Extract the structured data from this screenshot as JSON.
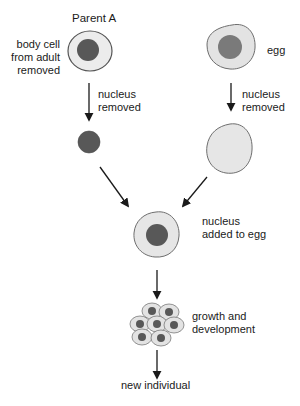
{
  "diagram": {
    "labels": {
      "parent_a": "Parent A",
      "body_cell": [
        "body cell",
        "from adult",
        "removed"
      ],
      "egg": "egg",
      "nucleus_removed_left": [
        "nucleus",
        "removed"
      ],
      "nucleus_removed_right": [
        "nucleus",
        "removed"
      ],
      "nucleus_added": [
        "nucleus",
        "added to egg"
      ],
      "growth": [
        "growth and",
        "development"
      ],
      "new_individual": "new individual"
    },
    "colors": {
      "cytoplasm": "#e6e6e6",
      "nucleus": "#585858",
      "egg_nucleus": "#7a7a7a",
      "outline": "#6e6e6e",
      "arrow": "#1a1a1a"
    }
  }
}
